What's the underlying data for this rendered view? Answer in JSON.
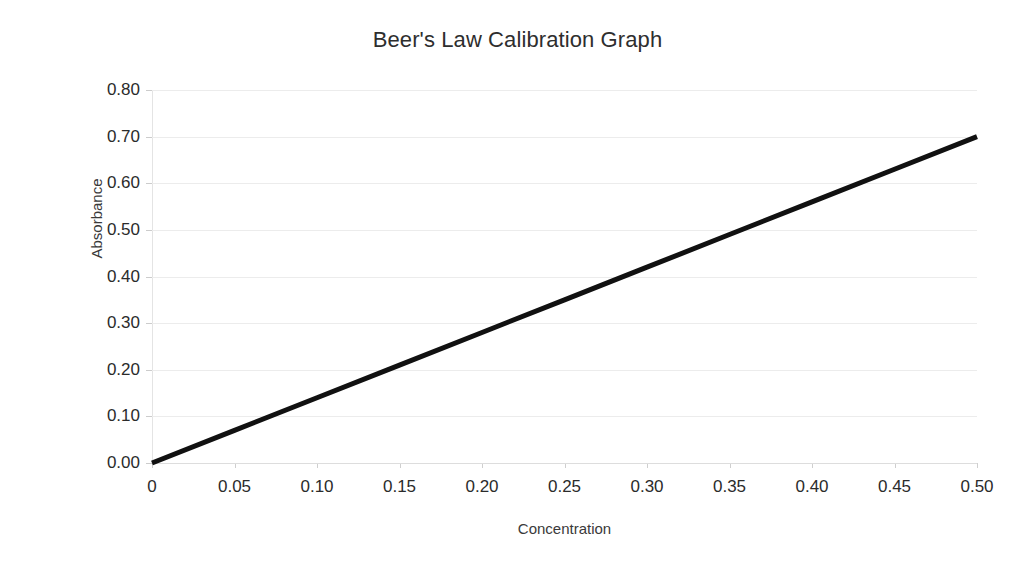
{
  "chart_data": {
    "type": "line",
    "title": "Beer's Law Calibration Graph",
    "xlabel": "Concentration",
    "ylabel": "Absorbance",
    "xlim": [
      0,
      0.5
    ],
    "ylim": [
      0,
      0.8
    ],
    "grid": true,
    "legend": null,
    "x_tick_labels": [
      "0",
      "0.05",
      "0.10",
      "0.15",
      "0.20",
      "0.25",
      "0.30",
      "0.35",
      "0.40",
      "0.45",
      "0.50"
    ],
    "x_ticks": [
      0,
      0.05,
      0.1,
      0.15,
      0.2,
      0.25,
      0.3,
      0.35,
      0.4,
      0.45,
      0.5
    ],
    "y_tick_labels": [
      "0.00",
      "0.10",
      "0.20",
      "0.30",
      "0.40",
      "0.50",
      "0.60",
      "0.70",
      "0.80"
    ],
    "y_ticks": [
      0,
      0.1,
      0.2,
      0.3,
      0.4,
      0.5,
      0.6,
      0.7,
      0.8
    ],
    "series": [
      {
        "name": "Calibration line",
        "color": "#111111",
        "line_width": 5,
        "x": [
          0,
          0.05,
          0.1,
          0.15,
          0.2,
          0.25,
          0.3,
          0.35,
          0.4,
          0.45,
          0.5
        ],
        "values": [
          0.0,
          0.07,
          0.14,
          0.21,
          0.28,
          0.35,
          0.42,
          0.49,
          0.56,
          0.63,
          0.7
        ]
      }
    ]
  },
  "colors": {
    "background": "#ffffff",
    "line": "#111111",
    "grid": "#ececec",
    "axis": "#e4e4e4",
    "text": "#2b2b2b"
  }
}
